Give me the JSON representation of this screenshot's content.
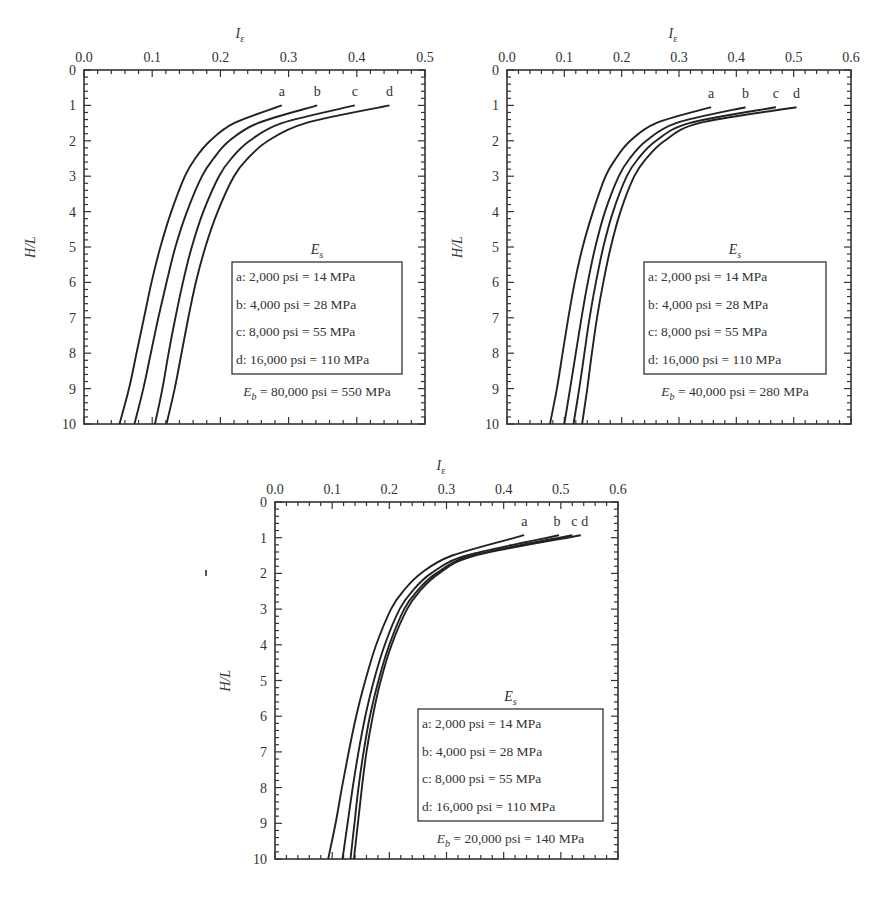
{
  "figure": {
    "x_axis_label": "I",
    "x_axis_label_subscript": "ε",
    "y_axis_label": "H/L",
    "legend_title": "E",
    "legend_title_subscript": "s",
    "legend_entries": [
      "a: 2,000 psi = 14 MPa",
      "b: 4,000 psi = 28 MPa",
      "c: 8,000 psi = 55 MPa",
      "d: 16,000 psi = 110 MPa"
    ]
  },
  "chart_data": [
    {
      "type": "line",
      "title": "",
      "xlabel": "Iε",
      "ylabel": "H/L",
      "xlim": [
        0.0,
        0.5
      ],
      "ylim": [
        10,
        0
      ],
      "x_axis_position": "top",
      "y_axis_inverted": true,
      "x_ticks": [
        "0.0",
        "0.1",
        "0.2",
        "0.3",
        "0.4",
        "0.5"
      ],
      "y_ticks": [
        "0",
        "1",
        "2",
        "3",
        "4",
        "5",
        "6",
        "7",
        "8",
        "9",
        "10"
      ],
      "grid": false,
      "eb_label": "= 80,000 psi = 550 MPa",
      "y": [
        1,
        1.5,
        2,
        2.5,
        3,
        4,
        5,
        6,
        7,
        8,
        9,
        10
      ],
      "series": [
        {
          "name": "a",
          "values": [
            0.29,
            0.22,
            0.185,
            0.163,
            0.148,
            0.128,
            0.112,
            0.099,
            0.088,
            0.077,
            0.066,
            0.052
          ]
        },
        {
          "name": "b",
          "values": [
            0.342,
            0.255,
            0.213,
            0.19,
            0.173,
            0.151,
            0.134,
            0.121,
            0.109,
            0.098,
            0.087,
            0.074
          ]
        },
        {
          "name": "c",
          "values": [
            0.397,
            0.29,
            0.243,
            0.216,
            0.198,
            0.175,
            0.158,
            0.145,
            0.134,
            0.124,
            0.115,
            0.104
          ]
        },
        {
          "name": "d",
          "values": [
            0.448,
            0.325,
            0.27,
            0.24,
            0.22,
            0.196,
            0.178,
            0.164,
            0.153,
            0.143,
            0.133,
            0.121
          ]
        }
      ],
      "legend_position": "lower right"
    },
    {
      "type": "line",
      "title": "",
      "xlabel": "Iε",
      "ylabel": "H/L",
      "xlim": [
        0.0,
        0.6
      ],
      "ylim": [
        10,
        0
      ],
      "x_axis_position": "top",
      "y_axis_inverted": true,
      "x_ticks": [
        "0.0",
        "0.1",
        "0.2",
        "0.3",
        "0.4",
        "0.5",
        "0.6"
      ],
      "y_ticks": [
        "0",
        "1",
        "2",
        "3",
        "4",
        "5",
        "6",
        "7",
        "8",
        "9",
        "10"
      ],
      "grid": false,
      "eb_label": "= 40,000 psi = 280 MPa",
      "y": [
        1.05,
        1.5,
        2,
        2.5,
        3,
        4,
        5,
        6,
        7,
        8,
        9,
        10
      ],
      "series": [
        {
          "name": "a",
          "values": [
            0.356,
            0.26,
            0.215,
            0.19,
            0.172,
            0.15,
            0.132,
            0.118,
            0.107,
            0.097,
            0.087,
            0.075
          ]
        },
        {
          "name": "b",
          "values": [
            0.416,
            0.295,
            0.243,
            0.214,
            0.195,
            0.171,
            0.154,
            0.141,
            0.13,
            0.12,
            0.11,
            0.1
          ]
        },
        {
          "name": "c",
          "values": [
            0.469,
            0.318,
            0.26,
            0.229,
            0.209,
            0.185,
            0.168,
            0.155,
            0.144,
            0.135,
            0.126,
            0.116
          ]
        },
        {
          "name": "d",
          "values": [
            0.505,
            0.335,
            0.275,
            0.243,
            0.222,
            0.198,
            0.181,
            0.168,
            0.157,
            0.148,
            0.14,
            0.131
          ]
        }
      ],
      "legend_position": "lower right"
    },
    {
      "type": "line",
      "title": "",
      "xlabel": "Iε",
      "ylabel": "H/L",
      "xlim": [
        0.0,
        0.6
      ],
      "ylim": [
        10,
        0
      ],
      "x_axis_position": "top",
      "y_axis_inverted": true,
      "x_ticks": [
        "0.0",
        "0.1",
        "0.2",
        "0.3",
        "0.4",
        "0.5",
        "0.6"
      ],
      "y_ticks": [
        "0",
        "1",
        "2",
        "3",
        "4",
        "5",
        "6",
        "7",
        "8",
        "9",
        "10"
      ],
      "grid": false,
      "eb_label": "= 20,000 psi = 140 MPa",
      "y": [
        0.93,
        1.5,
        2,
        2.5,
        3,
        4,
        5,
        6,
        7,
        8,
        9,
        10
      ],
      "series": [
        {
          "name": "a",
          "values": [
            0.436,
            0.31,
            0.255,
            0.224,
            0.203,
            0.177,
            0.158,
            0.142,
            0.129,
            0.117,
            0.106,
            0.093
          ]
        },
        {
          "name": "b",
          "values": [
            0.497,
            0.335,
            0.273,
            0.24,
            0.218,
            0.192,
            0.173,
            0.158,
            0.146,
            0.136,
            0.127,
            0.118
          ]
        },
        {
          "name": "c",
          "values": [
            0.52,
            0.345,
            0.282,
            0.248,
            0.226,
            0.2,
            0.181,
            0.166,
            0.155,
            0.146,
            0.139,
            0.132
          ]
        },
        {
          "name": "d",
          "values": [
            0.535,
            0.35,
            0.287,
            0.253,
            0.231,
            0.204,
            0.185,
            0.171,
            0.16,
            0.152,
            0.145,
            0.138
          ]
        }
      ],
      "legend_position": "lower right"
    }
  ]
}
